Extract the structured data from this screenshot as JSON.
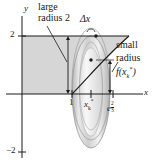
{
  "figure": {
    "type": "calculus-washer-method-diagram",
    "axes": {
      "x_label": "x",
      "y_label": "y",
      "y_ticks": [
        "2",
        "−2"
      ],
      "x_ticks": [
        "1",
        "x",
        "e"
      ],
      "x_tick_sub_star": "k",
      "x_tick_exponent_num": "2",
      "x_tick_exponent_den": "3"
    },
    "annotations": {
      "large_radius": {
        "line1": "large",
        "line2": "radius 2"
      },
      "delta_x": "Δx",
      "small_radius": {
        "line1": "small",
        "line2": "radius",
        "line3_f": "f(",
        "line3_x": "x",
        "line3_sub": "k",
        "line3_star": "*",
        "line3_close": ")"
      }
    },
    "colors": {
      "region_fill": "#d6d6d6",
      "stroke": "#1a1a1a",
      "washer_light": "#ececec",
      "washer_mid": "#c9c9c9",
      "washer_dark": "#a9a9a9"
    }
  }
}
